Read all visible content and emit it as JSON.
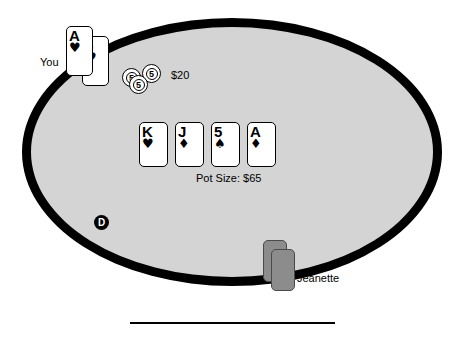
{
  "table": {
    "felt_color": "#d4d4d4",
    "rail_color": "#000000"
  },
  "hero": {
    "label": "You",
    "bet_label": "$20",
    "hole_cards": [
      {
        "rank": "A",
        "suit": "♥",
        "suit_name": "hearts"
      },
      {
        "rank": "5",
        "suit": "♥",
        "suit_name": "hearts"
      }
    ],
    "chips": [
      {
        "value": "5"
      },
      {
        "value": "5"
      },
      {
        "value": "5"
      }
    ]
  },
  "board": {
    "pot_label": "Pot Size: $65",
    "cards": [
      {
        "rank": "K",
        "suit": "♥",
        "suit_name": "hearts"
      },
      {
        "rank": "J",
        "suit": "♦",
        "suit_name": "diamonds"
      },
      {
        "rank": "5",
        "suit": "♠",
        "suit_name": "spades"
      },
      {
        "rank": "A",
        "suit": "♦",
        "suit_name": "diamonds"
      }
    ]
  },
  "opponent": {
    "label": "Jeanette",
    "facedown_count": 2
  },
  "dealer": {
    "label": "D"
  }
}
